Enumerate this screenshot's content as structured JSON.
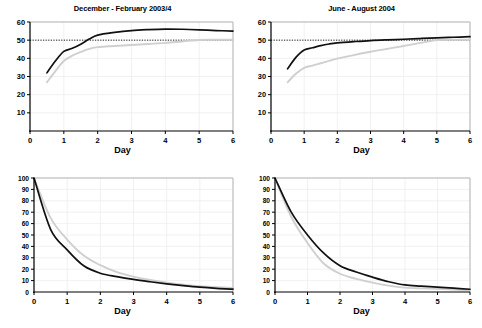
{
  "figure": {
    "panels": [
      {
        "id": "top-left",
        "title": "December - February 2003/4",
        "xlabel": "Day",
        "ylabel": "",
        "xlim": [
          0,
          6
        ],
        "ylim": [
          0,
          60
        ],
        "xticks": [
          0,
          1,
          2,
          3,
          4,
          5,
          6
        ],
        "yticks": [
          10,
          20,
          30,
          40,
          50,
          60
        ],
        "reference_line": 50
      },
      {
        "id": "top-right",
        "title": "June - August 2004",
        "xlabel": "Day",
        "ylabel": "",
        "xlim": [
          0,
          6
        ],
        "ylim": [
          0,
          60
        ],
        "xticks": [
          0,
          1,
          2,
          3,
          4,
          5,
          6
        ],
        "yticks": [
          10,
          20,
          30,
          40,
          50,
          60
        ],
        "reference_line": 50
      },
      {
        "id": "bottom-left",
        "title": "",
        "xlabel": "Day",
        "ylabel": "",
        "xlim": [
          0,
          6
        ],
        "ylim": [
          0,
          100
        ],
        "xticks": [
          0,
          1,
          2,
          3,
          4,
          5,
          6
        ],
        "yticks": [
          10,
          20,
          30,
          40,
          50,
          60,
          70,
          80,
          90,
          100
        ],
        "reference_line": null
      },
      {
        "id": "bottom-right",
        "title": "",
        "xlabel": "Day",
        "ylabel": "",
        "xlim": [
          0,
          6
        ],
        "ylim": [
          0,
          100
        ],
        "xticks": [
          0,
          1,
          2,
          3,
          4,
          5,
          6
        ],
        "yticks": [
          10,
          20,
          30,
          40,
          50,
          60,
          70,
          80,
          90,
          100
        ],
        "reference_line": null
      }
    ]
  },
  "colors": {
    "series_black": "#111111",
    "series_gray": "#cfcfcf",
    "axis": "#000000",
    "grid": "#eeeeee",
    "frame": "#b5b5b5",
    "reference": "#222222",
    "background": "#ffffff"
  },
  "chart_data": [
    {
      "type": "line",
      "id": "top-left",
      "title": "December - February 2003/4",
      "xlabel": "Day",
      "ylabel": "",
      "xlim": [
        0,
        6
      ],
      "ylim": [
        0,
        60
      ],
      "xticks": [
        0,
        1,
        2,
        3,
        4,
        5,
        6
      ],
      "yticks": [
        10,
        20,
        30,
        40,
        50,
        60
      ],
      "grid": true,
      "legend": "none",
      "annotations": [
        {
          "type": "hline",
          "y": 50,
          "style": "dotted",
          "label": "50"
        }
      ],
      "series": [
        {
          "name": "black",
          "color": "#111111",
          "x": [
            0.5,
            0.75,
            1.0,
            1.25,
            1.5,
            1.75,
            2.0,
            2.5,
            3.0,
            3.5,
            4.0,
            4.5,
            5.0,
            5.5,
            6.0
          ],
          "values": [
            32.0,
            38.5,
            43.8,
            45.5,
            47.8,
            50.6,
            52.8,
            54.3,
            55.3,
            55.8,
            56.1,
            56.0,
            55.7,
            55.3,
            55.0
          ]
        },
        {
          "name": "gray",
          "color": "#cfcfcf",
          "x": [
            0.5,
            0.75,
            1.0,
            1.25,
            1.5,
            1.75,
            2.0,
            2.5,
            3.0,
            3.5,
            4.0,
            4.5,
            5.0,
            5.5,
            6.0
          ],
          "values": [
            26.8,
            33.0,
            38.5,
            41.5,
            43.5,
            45.2,
            46.2,
            46.8,
            47.3,
            47.9,
            48.5,
            49.3,
            50.1,
            50.2,
            50.2
          ]
        }
      ]
    },
    {
      "type": "line",
      "id": "top-right",
      "title": "June - August 2004",
      "xlabel": "Day",
      "ylabel": "",
      "xlim": [
        0,
        6
      ],
      "ylim": [
        0,
        60
      ],
      "xticks": [
        0,
        1,
        2,
        3,
        4,
        5,
        6
      ],
      "yticks": [
        10,
        20,
        30,
        40,
        50,
        60
      ],
      "grid": true,
      "legend": "none",
      "annotations": [
        {
          "type": "hline",
          "y": 50,
          "style": "dotted",
          "label": "50"
        }
      ],
      "series": [
        {
          "name": "black",
          "color": "#111111",
          "x": [
            0.5,
            0.75,
            1.0,
            1.25,
            1.5,
            1.75,
            2.0,
            2.5,
            3.0,
            3.5,
            4.0,
            4.5,
            5.0,
            5.5,
            6.0
          ],
          "values": [
            34.2,
            40.5,
            44.6,
            45.8,
            47.0,
            47.9,
            48.5,
            49.2,
            49.8,
            50.2,
            50.5,
            50.9,
            51.3,
            51.6,
            51.9
          ]
        },
        {
          "name": "gray",
          "color": "#cfcfcf",
          "x": [
            0.5,
            0.75,
            1.0,
            1.25,
            1.5,
            1.75,
            2.0,
            2.5,
            3.0,
            3.5,
            4.0,
            4.5,
            5.0,
            5.5,
            6.0
          ],
          "values": [
            26.8,
            31.5,
            34.8,
            36.0,
            37.3,
            38.6,
            39.8,
            41.8,
            43.6,
            45.2,
            46.8,
            48.5,
            50.0,
            50.2,
            50.2
          ]
        }
      ]
    },
    {
      "type": "line",
      "id": "bottom-left",
      "title": "",
      "xlabel": "Day",
      "ylabel": "",
      "xlim": [
        0,
        6
      ],
      "ylim": [
        0,
        100
      ],
      "xticks": [
        0,
        1,
        2,
        3,
        4,
        5,
        6
      ],
      "yticks": [
        10,
        20,
        30,
        40,
        50,
        60,
        70,
        80,
        90,
        100
      ],
      "grid": true,
      "legend": "none",
      "series": [
        {
          "name": "black",
          "color": "#111111",
          "x": [
            0.0,
            0.5,
            1.0,
            1.5,
            2.0,
            2.5,
            3.0,
            3.5,
            4.0,
            4.5,
            5.0,
            5.5,
            6.0
          ],
          "values": [
            100.0,
            55.0,
            37.0,
            23.0,
            16.5,
            13.5,
            11.0,
            9.0,
            7.2,
            5.6,
            4.2,
            3.2,
            2.5
          ]
        },
        {
          "name": "gray",
          "color": "#cfcfcf",
          "x": [
            0.0,
            0.5,
            1.0,
            1.5,
            2.0,
            2.5,
            3.0,
            3.5,
            4.0,
            4.5,
            5.0,
            5.5,
            6.0
          ],
          "values": [
            100.0,
            65.0,
            46.0,
            32.0,
            23.5,
            17.5,
            13.5,
            10.5,
            8.2,
            6.4,
            5.0,
            4.2,
            3.5
          ]
        }
      ]
    },
    {
      "type": "line",
      "id": "bottom-right",
      "title": "",
      "xlabel": "Day",
      "ylabel": "",
      "xlim": [
        0,
        6
      ],
      "ylim": [
        0,
        100
      ],
      "xticks": [
        0,
        1,
        2,
        3,
        4,
        5,
        6
      ],
      "yticks": [
        10,
        20,
        30,
        40,
        50,
        60,
        70,
        80,
        90,
        100
      ],
      "grid": true,
      "legend": "none",
      "series": [
        {
          "name": "black",
          "color": "#111111",
          "x": [
            0.0,
            0.5,
            1.0,
            1.5,
            2.0,
            2.5,
            3.0,
            3.5,
            4.0,
            4.5,
            5.0,
            5.5,
            6.0
          ],
          "values": [
            100.0,
            70.0,
            50.0,
            34.0,
            23.0,
            17.5,
            13.0,
            9.0,
            6.2,
            5.2,
            4.3,
            3.4,
            2.4
          ]
        },
        {
          "name": "gray",
          "color": "#cfcfcf",
          "x": [
            0.0,
            0.5,
            1.0,
            1.5,
            2.0,
            2.5,
            3.0,
            3.5,
            4.0,
            4.5,
            5.0,
            5.5,
            6.0
          ],
          "values": [
            100.0,
            66.0,
            43.0,
            25.0,
            16.0,
            11.5,
            8.2,
            5.6,
            3.8,
            3.2,
            2.8,
            2.2,
            1.6
          ]
        }
      ]
    }
  ]
}
